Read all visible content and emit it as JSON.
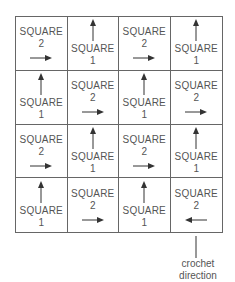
{
  "diagram": {
    "title": "",
    "cell_label": "SQUARE",
    "rows": [
      [
        {
          "square": "2",
          "direction": "right"
        },
        {
          "square": "1",
          "direction": "up"
        },
        {
          "square": "2",
          "direction": "right"
        },
        {
          "square": "1",
          "direction": "up"
        }
      ],
      [
        {
          "square": "1",
          "direction": "up"
        },
        {
          "square": "2",
          "direction": "right"
        },
        {
          "square": "1",
          "direction": "up"
        },
        {
          "square": "2",
          "direction": "right"
        }
      ],
      [
        {
          "square": "2",
          "direction": "right"
        },
        {
          "square": "1",
          "direction": "up"
        },
        {
          "square": "2",
          "direction": "right"
        },
        {
          "square": "1",
          "direction": "up"
        }
      ],
      [
        {
          "square": "1",
          "direction": "up"
        },
        {
          "square": "2",
          "direction": "right"
        },
        {
          "square": "1",
          "direction": "up"
        },
        {
          "square": "2",
          "direction": "left"
        }
      ]
    ],
    "caption_line1": "crochet",
    "caption_line2": "direction",
    "colors": {
      "line": "#666666",
      "text": "#555555",
      "arrow": "#333333"
    }
  }
}
